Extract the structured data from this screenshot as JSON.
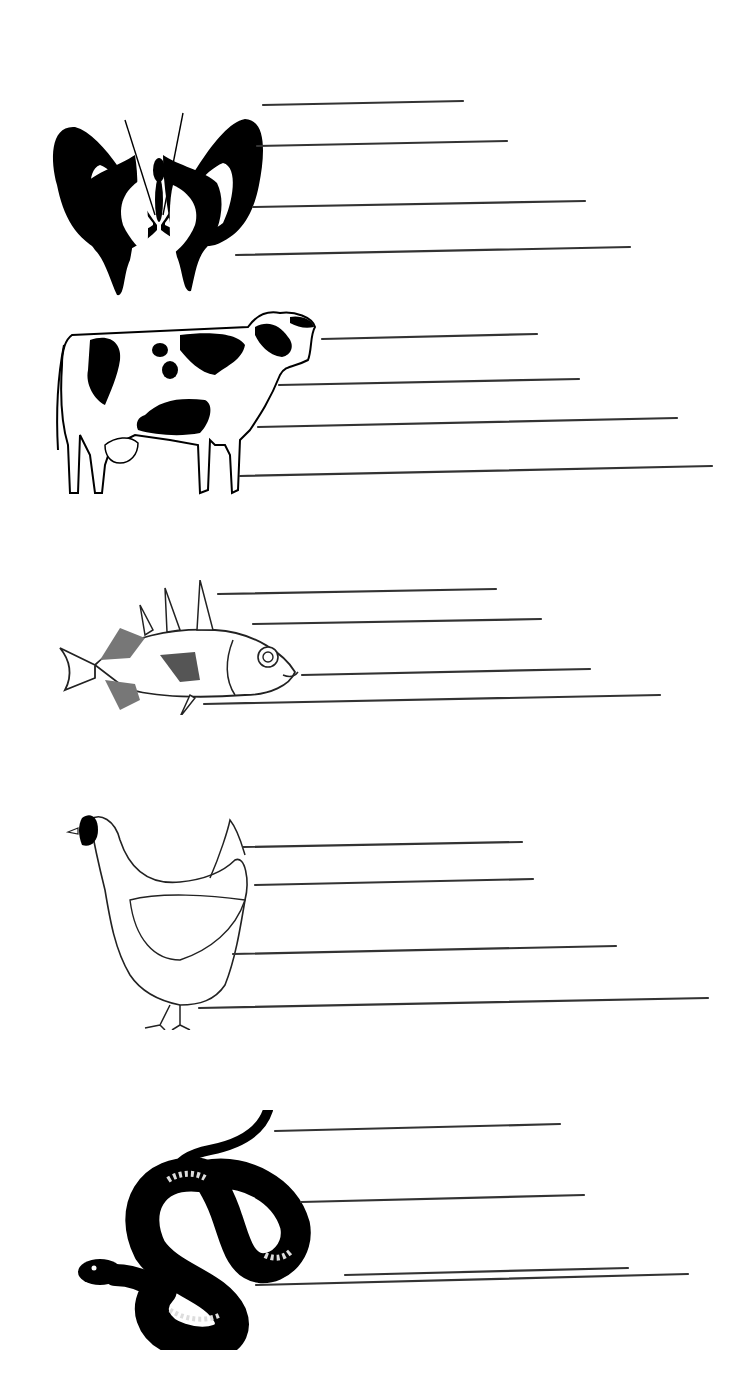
{
  "worksheet": {
    "type": "label-the-animal-parts",
    "line_color": "#333333",
    "ink_color": "#000000",
    "background": "#ffffff",
    "sections": [
      {
        "animal": "butterfly",
        "icon": "butterfly-icon",
        "answer_lines": [
          {
            "x1": 263,
            "y1": 105,
            "x2": 463,
            "y2": 101,
            "value": ""
          },
          {
            "x1": 257,
            "y1": 146,
            "x2": 507,
            "y2": 141,
            "value": ""
          },
          {
            "x1": 253,
            "y1": 207,
            "x2": 585,
            "y2": 201,
            "value": ""
          },
          {
            "x1": 236,
            "y1": 255,
            "x2": 630,
            "y2": 247,
            "value": ""
          }
        ]
      },
      {
        "animal": "cow",
        "icon": "cow-icon",
        "answer_lines": [
          {
            "x1": 322,
            "y1": 339,
            "x2": 537,
            "y2": 334,
            "value": ""
          },
          {
            "x1": 279,
            "y1": 385,
            "x2": 579,
            "y2": 379,
            "value": ""
          },
          {
            "x1": 258,
            "y1": 427,
            "x2": 677,
            "y2": 418,
            "value": ""
          },
          {
            "x1": 240,
            "y1": 476,
            "x2": 712,
            "y2": 466,
            "value": ""
          }
        ]
      },
      {
        "animal": "fish",
        "icon": "fish-icon",
        "answer_lines": [
          {
            "x1": 218,
            "y1": 594,
            "x2": 496,
            "y2": 589,
            "value": ""
          },
          {
            "x1": 253,
            "y1": 624,
            "x2": 541,
            "y2": 619,
            "value": ""
          },
          {
            "x1": 302,
            "y1": 675,
            "x2": 590,
            "y2": 669,
            "value": ""
          },
          {
            "x1": 204,
            "y1": 704,
            "x2": 660,
            "y2": 695,
            "value": ""
          }
        ]
      },
      {
        "animal": "hen",
        "icon": "hen-icon",
        "answer_lines": [
          {
            "x1": 243,
            "y1": 847,
            "x2": 522,
            "y2": 842,
            "value": ""
          },
          {
            "x1": 255,
            "y1": 885,
            "x2": 533,
            "y2": 879,
            "value": ""
          },
          {
            "x1": 233,
            "y1": 954,
            "x2": 616,
            "y2": 946,
            "value": ""
          },
          {
            "x1": 199,
            "y1": 1008,
            "x2": 708,
            "y2": 998,
            "value": ""
          }
        ]
      },
      {
        "animal": "snake",
        "icon": "snake-icon",
        "answer_lines": [
          {
            "x1": 275,
            "y1": 1131,
            "x2": 560,
            "y2": 1124,
            "value": ""
          },
          {
            "x1": 301,
            "y1": 1202,
            "x2": 584,
            "y2": 1195,
            "value": ""
          },
          {
            "x1": 345,
            "y1": 1275,
            "x2": 628,
            "y2": 1268,
            "value": ""
          },
          {
            "x1": 256,
            "y1": 1381,
            "x2": 688,
            "y2": 1370,
            "value": ""
          }
        ]
      }
    ]
  }
}
